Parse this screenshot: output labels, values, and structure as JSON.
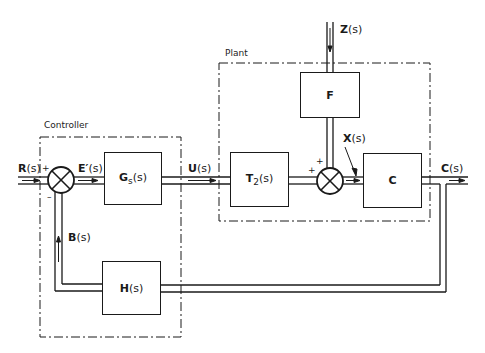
{
  "groups": {
    "controller": {
      "label": "Controller"
    },
    "plant": {
      "label": "Plant"
    }
  },
  "blocks": {
    "g": {
      "name": "G",
      "sub": "s",
      "arg": "(s)"
    },
    "t2": {
      "name": "T",
      "sub": "2",
      "arg": "(s)"
    },
    "f": {
      "name": "F"
    },
    "c": {
      "name": "C"
    },
    "h": {
      "name": "H",
      "arg": "(s)"
    }
  },
  "signals": {
    "r": {
      "name": "R",
      "arg": "(s)"
    },
    "e": {
      "name": "E′",
      "arg": "(s)"
    },
    "u": {
      "name": "U",
      "arg": "(s)"
    },
    "z": {
      "name": "Z",
      "arg": "(s)"
    },
    "x": {
      "name": "X",
      "arg": "(s)"
    },
    "c": {
      "name": "C",
      "arg": "(s)"
    },
    "b": {
      "name": "B",
      "arg": "(s)"
    }
  },
  "junctions": {
    "sum1": {
      "sign_in": "+",
      "sign_fb": "–"
    },
    "sum2": {
      "sign_top": "+",
      "sign_left": "+"
    }
  }
}
